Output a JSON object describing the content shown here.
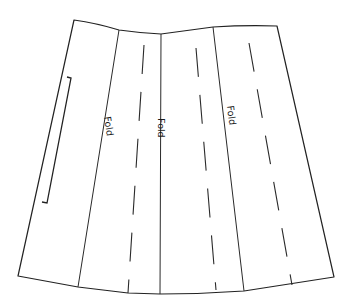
{
  "diagram": {
    "type": "sewing-pattern-piece",
    "colors": {
      "background": "#ffffff",
      "line": "#222222"
    },
    "labels": {
      "fold_1": "Fold",
      "fold_2": "Fold",
      "fold_3": "Fold"
    },
    "outline_points": [
      [
        74,
        20
      ],
      [
        119,
        30
      ],
      [
        161,
        34
      ],
      [
        213,
        27
      ],
      [
        277,
        26
      ],
      [
        334,
        277
      ],
      [
        244,
        291
      ],
      [
        160,
        294
      ],
      [
        128,
        293
      ],
      [
        78,
        287
      ],
      [
        18,
        276
      ]
    ],
    "fold_lines": [
      {
        "from": [
          119,
          30
        ],
        "to": [
          78,
          287
        ],
        "label": "Fold"
      },
      {
        "from": [
          161,
          34
        ],
        "to": [
          160,
          294
        ],
        "label": "Fold"
      },
      {
        "from": [
          213,
          27
        ],
        "to": [
          244,
          291
        ],
        "label": "Fold"
      }
    ],
    "dashed_lines": [
      {
        "from": [
          144,
          45
        ],
        "to": [
          128,
          293
        ]
      },
      {
        "from": [
          196,
          48
        ],
        "to": [
          216,
          290
        ]
      },
      {
        "from": [
          249,
          43
        ],
        "to": [
          292,
          285
        ]
      }
    ],
    "bracket": {
      "from": [
        70,
        77
      ],
      "to": [
        46,
        203
      ]
    }
  }
}
